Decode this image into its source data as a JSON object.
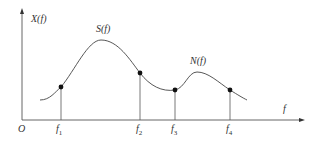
{
  "diagram": {
    "axis_y_label": "X(f)",
    "axis_x_label": "f",
    "origin_label": "O",
    "curve_labels": {
      "signal": "S(f)",
      "noise": "N(f)"
    },
    "ticks": [
      {
        "base": "f",
        "sub": "1"
      },
      {
        "base": "f",
        "sub": "2"
      },
      {
        "base": "f",
        "sub": "3"
      },
      {
        "base": "f",
        "sub": "4"
      }
    ],
    "colors": {
      "line": "#444444",
      "dot": "#111111"
    }
  }
}
